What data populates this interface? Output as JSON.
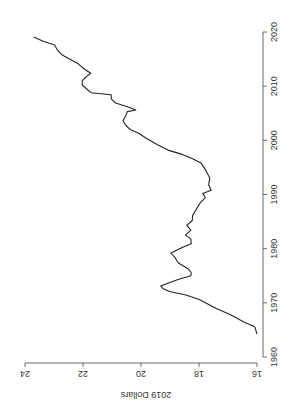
{
  "chart_data": {
    "type": "line",
    "title": "",
    "xlabel": "",
    "ylabel": "2019 Dollars",
    "orientation_note": "figure rendered rotated 90° counter-clockwise",
    "xlim": [
      1960,
      2020
    ],
    "ylim": [
      16,
      24
    ],
    "x_ticks": [
      1960,
      1970,
      1980,
      1990,
      2000,
      2010,
      2020
    ],
    "y_ticks": [
      16,
      18,
      20,
      22,
      24
    ],
    "grid": false,
    "legend": null,
    "series": [
      {
        "name": "2019 Dollars",
        "color": "#222222",
        "points": [
          [
            1964.2,
            16.0
          ],
          [
            1965.6,
            16.1
          ],
          [
            1966.5,
            16.45
          ],
          [
            1967.8,
            16.93
          ],
          [
            1969.0,
            17.4
          ],
          [
            1970.0,
            17.8
          ],
          [
            1970.6,
            17.97
          ],
          [
            1971.5,
            18.5
          ],
          [
            1972.1,
            19.0
          ],
          [
            1972.6,
            19.25
          ],
          [
            1973.1,
            19.3
          ],
          [
            1973.7,
            19.05
          ],
          [
            1974.3,
            18.7
          ],
          [
            1975.0,
            18.3
          ],
          [
            1975.6,
            18.25
          ],
          [
            1976.3,
            18.4
          ],
          [
            1977.4,
            18.7
          ],
          [
            1978.4,
            18.85
          ],
          [
            1979.2,
            18.95
          ],
          [
            1980.2,
            18.6
          ],
          [
            1980.9,
            18.25
          ],
          [
            1981.8,
            18.3
          ],
          [
            1982.5,
            18.45
          ],
          [
            1983.4,
            18.3
          ],
          [
            1984.3,
            18.4
          ],
          [
            1985.2,
            18.25
          ],
          [
            1986.1,
            18.2
          ],
          [
            1987.4,
            18.1
          ],
          [
            1988.4,
            17.95
          ],
          [
            1989.4,
            17.8
          ],
          [
            1990.2,
            17.85
          ],
          [
            1990.8,
            17.6
          ],
          [
            1991.8,
            17.65
          ],
          [
            1993.0,
            17.65
          ],
          [
            1994.5,
            17.75
          ],
          [
            1995.8,
            17.95
          ],
          [
            1996.6,
            18.2
          ],
          [
            1997.4,
            18.6
          ],
          [
            1998.2,
            19.05
          ],
          [
            1999.2,
            19.45
          ],
          [
            2000.4,
            19.8
          ],
          [
            2001.3,
            20.1
          ],
          [
            2002.0,
            20.35
          ],
          [
            2002.8,
            20.55
          ],
          [
            2003.6,
            20.6
          ],
          [
            2004.5,
            20.55
          ],
          [
            2005.3,
            20.45
          ],
          [
            2005.6,
            20.2
          ],
          [
            2006.2,
            20.45
          ],
          [
            2006.9,
            20.9
          ],
          [
            2007.6,
            21.0
          ],
          [
            2008.4,
            21.05
          ],
          [
            2008.8,
            21.7
          ],
          [
            2009.3,
            21.85
          ],
          [
            2010.2,
            22.0
          ],
          [
            2011.0,
            22.05
          ],
          [
            2011.8,
            21.85
          ],
          [
            2012.4,
            21.75
          ],
          [
            2013.2,
            21.95
          ],
          [
            2014.2,
            22.2
          ],
          [
            2015.0,
            22.45
          ],
          [
            2015.8,
            22.75
          ],
          [
            2016.6,
            22.85
          ],
          [
            2017.6,
            23.0
          ],
          [
            2018.3,
            23.35
          ],
          [
            2019.1,
            23.7
          ]
        ]
      }
    ]
  }
}
